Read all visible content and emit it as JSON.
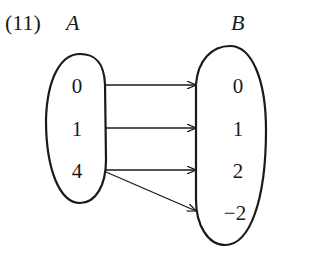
{
  "problem_number": "(11)",
  "set_a": {
    "label": "A",
    "elements": [
      "0",
      "1",
      "4"
    ]
  },
  "set_b": {
    "label": "B",
    "elements": [
      "0",
      "1",
      "2",
      "−2"
    ]
  },
  "mappings": [
    {
      "from": "0",
      "to": "0"
    },
    {
      "from": "1",
      "to": "1"
    },
    {
      "from": "4",
      "to": "2"
    },
    {
      "from": "4",
      "to": "−2"
    }
  ]
}
